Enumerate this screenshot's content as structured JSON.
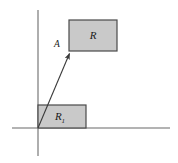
{
  "figure": {
    "background_color": "#ffffff",
    "width": 178,
    "height": 163
  },
  "axes": {
    "name": "coordinate-axes",
    "color": "#9a9a9a",
    "stroke_width": 1.6,
    "x_axis": {
      "label": "",
      "x1": 12,
      "y1": 128,
      "x2": 170,
      "y2": 128
    },
    "y_axis": {
      "label": "",
      "x1": 38,
      "y1": 10,
      "x2": 38,
      "y2": 156
    },
    "origin": {
      "x": 38,
      "y": 128
    }
  },
  "shapes": [
    {
      "id": "rect-R",
      "label": "R",
      "subscript": "",
      "fill": "#c9c9c9",
      "stroke": "#4a4a4a",
      "x": 69,
      "y": 20,
      "width": 48,
      "height": 31,
      "label_x": 93,
      "label_y": 39
    },
    {
      "id": "rect-R1",
      "label": "R",
      "subscript": "1",
      "fill": "#c9c9c9",
      "stroke": "#4a4a4a",
      "x": 38,
      "y": 105,
      "width": 48,
      "height": 23,
      "label_x": 60,
      "label_y": 120
    }
  ],
  "arrow": {
    "id": "displacement-vector",
    "label": "A",
    "color": "#3a3a3a",
    "stroke_width": 1.1,
    "start": {
      "x": 38,
      "y": 128
    },
    "end": {
      "x": 70,
      "y": 52
    },
    "label_x": 57,
    "label_y": 47
  }
}
